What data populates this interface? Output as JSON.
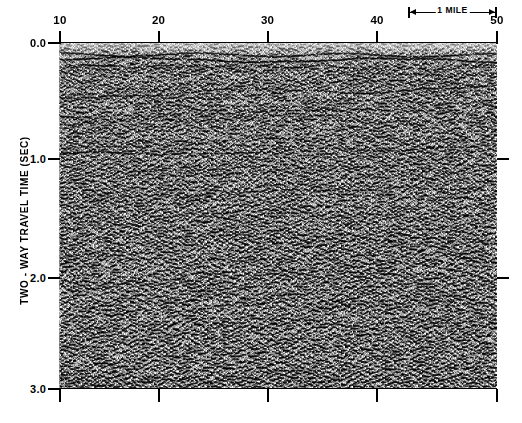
{
  "figure": {
    "background_color": "#ffffff",
    "ink_color": "#000000"
  },
  "y_axis": {
    "title": "TWO - WAY  TRAVEL TIME (SEC)",
    "unit": "SEC",
    "ticks": [
      "0.0",
      "1.0",
      "2.0",
      "3.0"
    ],
    "tick_values": [
      0.0,
      1.0,
      2.0,
      3.0
    ],
    "range": [
      0.0,
      3.0
    ],
    "direction": "downward"
  },
  "x_axis": {
    "title": "",
    "ticks": [
      "10",
      "20",
      "30",
      "40",
      "50"
    ],
    "tick_values": [
      10,
      20,
      30,
      40,
      50
    ],
    "range": [
      10,
      50
    ],
    "unit": "shotpoint"
  },
  "scale_bar": {
    "label": "1 MILE",
    "length_px": 89,
    "left_cap": "arrow-left",
    "right_cap": "arrow-right"
  },
  "chart_data": {
    "type": "heatmap",
    "xlabel": "",
    "ylabel": "TWO - WAY  TRAVEL TIME (SEC)",
    "x": [
      10,
      20,
      30,
      40,
      50
    ],
    "xlim": [
      10,
      50
    ],
    "ylim": [
      0.0,
      3.0
    ],
    "y_inverted": true,
    "grid": false,
    "legend": "none",
    "display_style": "variable-area wiggle trace",
    "trace_count": 330,
    "colormap": "grayscale",
    "reflectors": [
      {
        "name": "seafloor-multiple-shallow",
        "time_start": 0.1,
        "time_end": 0.11,
        "amplitude": 0.95,
        "continuity": 1.0
      },
      {
        "name": "strong-shallow-doublet",
        "time_start": 0.145,
        "time_end": 0.155,
        "amplitude": 1.0,
        "continuity": 1.0
      },
      {
        "name": "shallow-band-3",
        "time_start": 0.2,
        "time_end": 0.22,
        "amplitude": 0.6,
        "continuity": 0.9
      },
      {
        "name": "mid-dipping-west",
        "time_start": 0.46,
        "time_end": 0.39,
        "amplitude": 0.7,
        "continuity": 0.75
      },
      {
        "name": "reflector-0p62",
        "time_start": 0.63,
        "time_end": 0.58,
        "amplitude": 0.55,
        "continuity": 0.7
      },
      {
        "name": "reflector-0p95",
        "time_start": 0.98,
        "time_end": 0.9,
        "amplitude": 0.75,
        "continuity": 0.8
      },
      {
        "name": "reflector-1p10",
        "time_start": 1.12,
        "time_end": 1.05,
        "amplitude": 0.65,
        "continuity": 0.7
      },
      {
        "name": "reflector-1p30",
        "time_start": 1.33,
        "time_end": 1.24,
        "amplitude": 0.6,
        "continuity": 0.6
      },
      {
        "name": "reflector-1p55",
        "time_start": 1.58,
        "time_end": 1.48,
        "amplitude": 0.5,
        "continuity": 0.5
      },
      {
        "name": "reflector-1p80",
        "time_start": 1.82,
        "time_end": 1.74,
        "amplitude": 0.42,
        "continuity": 0.4
      }
    ],
    "noise_zone": {
      "time_start": 2.0,
      "time_end": 3.0,
      "character": "incoherent high-amplitude noise"
    }
  }
}
